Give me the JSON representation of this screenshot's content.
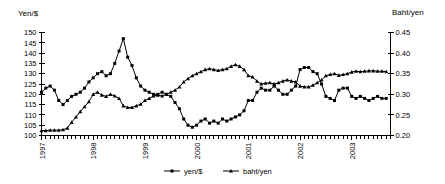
{
  "chart_data": {
    "type": "line",
    "title": "",
    "xlabel": "",
    "ylabel": "Yen/$",
    "y2label": "Baht/yen",
    "grid": false,
    "legend_position": "bottom-center",
    "xlim": [
      1997.0,
      2003.75
    ],
    "ylim": [
      100,
      150
    ],
    "y2lim": [
      0.2,
      0.45
    ],
    "ytick_labels": [
      "100",
      "105",
      "110",
      "115",
      "120",
      "125",
      "130",
      "135",
      "140",
      "145",
      "150"
    ],
    "ytick_values": [
      100,
      105,
      110,
      115,
      120,
      125,
      130,
      135,
      140,
      145,
      150
    ],
    "y2tick_labels": [
      "0.20",
      "0.25",
      "0.30",
      "0.35",
      "0.40",
      "0.45"
    ],
    "y2tick_values": [
      0.2,
      0.25,
      0.3,
      0.35,
      0.4,
      0.45
    ],
    "xtick_labels": [
      "1997",
      "1998",
      "1999",
      "2000",
      "2001",
      "2002",
      "2003"
    ],
    "xtick_values": [
      1997,
      1998,
      1999,
      2000,
      2001,
      2002,
      2003
    ],
    "x_minor_tick_interval_months": 1,
    "series": [
      {
        "name": "yen/$",
        "axis": "left",
        "marker": "square",
        "x": [
          1997.0,
          1997.083,
          1997.167,
          1997.25,
          1997.333,
          1997.417,
          1997.5,
          1997.583,
          1997.667,
          1997.75,
          1997.833,
          1997.917,
          1998.0,
          1998.083,
          1998.167,
          1998.25,
          1998.333,
          1998.417,
          1998.5,
          1998.583,
          1998.667,
          1998.75,
          1998.833,
          1998.917,
          1999.0,
          1999.083,
          1999.167,
          1999.25,
          1999.333,
          1999.417,
          1999.5,
          1999.583,
          1999.667,
          1999.75,
          1999.833,
          1999.917,
          2000.0,
          2000.083,
          2000.167,
          2000.25,
          2000.333,
          2000.417,
          2000.5,
          2000.583,
          2000.667,
          2000.75,
          2000.833,
          2000.917,
          2001.0,
          2001.083,
          2001.167,
          2001.25,
          2001.333,
          2001.417,
          2001.5,
          2001.583,
          2001.667,
          2001.75,
          2001.833,
          2001.917,
          2002.0,
          2002.083,
          2002.167,
          2002.25,
          2002.333,
          2002.417,
          2002.5,
          2002.583,
          2002.667,
          2002.75,
          2002.833,
          2002.917,
          2003.0,
          2003.083,
          2003.167,
          2003.25,
          2003.333,
          2003.417,
          2003.5,
          2003.583,
          2003.667
        ],
        "values": [
          121,
          123,
          124,
          122,
          117,
          115,
          117,
          119,
          120,
          121,
          123,
          126,
          128,
          130,
          131,
          129,
          130,
          135,
          141,
          147,
          138,
          134,
          128,
          124,
          122,
          121,
          120,
          120,
          121,
          120,
          119,
          116,
          113,
          108,
          105,
          104,
          105,
          107,
          108,
          106,
          107,
          106,
          108,
          107,
          108,
          109,
          110,
          112,
          117,
          117,
          121,
          123,
          122,
          122,
          124,
          122,
          120,
          120,
          122,
          124,
          132,
          133,
          133,
          131,
          130,
          125,
          119,
          118,
          117,
          122,
          123,
          123,
          119,
          118,
          119,
          118,
          117,
          118,
          119,
          118,
          118
        ]
      },
      {
        "name": "baht/yen",
        "axis": "right",
        "marker": "triangle",
        "x": [
          1997.0,
          1997.083,
          1997.167,
          1997.25,
          1997.333,
          1997.417,
          1997.5,
          1997.583,
          1997.667,
          1997.75,
          1997.833,
          1997.917,
          1998.0,
          1998.083,
          1998.167,
          1998.25,
          1998.333,
          1998.417,
          1998.5,
          1998.583,
          1998.667,
          1998.75,
          1998.833,
          1998.917,
          1999.0,
          1999.083,
          1999.167,
          1999.25,
          1999.333,
          1999.417,
          1999.5,
          1999.583,
          1999.667,
          1999.75,
          1999.833,
          1999.917,
          2000.0,
          2000.083,
          2000.167,
          2000.25,
          2000.333,
          2000.417,
          2000.5,
          2000.583,
          2000.667,
          2000.75,
          2000.833,
          2000.917,
          2001.0,
          2001.083,
          2001.167,
          2001.25,
          2001.333,
          2001.417,
          2001.5,
          2001.583,
          2001.667,
          2001.75,
          2001.833,
          2001.917,
          2002.0,
          2002.083,
          2002.167,
          2002.25,
          2002.333,
          2002.417,
          2002.5,
          2002.583,
          2002.667,
          2002.75,
          2002.833,
          2002.917,
          2003.0,
          2003.083,
          2003.167,
          2003.25,
          2003.333,
          2003.417,
          2003.5,
          2003.583,
          2003.667
        ],
        "values": [
          0.212,
          0.212,
          0.213,
          0.213,
          0.213,
          0.214,
          0.218,
          0.232,
          0.245,
          0.258,
          0.27,
          0.282,
          0.3,
          0.305,
          0.298,
          0.295,
          0.3,
          0.296,
          0.29,
          0.272,
          0.268,
          0.268,
          0.272,
          0.276,
          0.285,
          0.29,
          0.296,
          0.298,
          0.296,
          0.3,
          0.305,
          0.31,
          0.318,
          0.33,
          0.338,
          0.345,
          0.35,
          0.355,
          0.36,
          0.362,
          0.36,
          0.358,
          0.36,
          0.362,
          0.368,
          0.372,
          0.368,
          0.36,
          0.345,
          0.342,
          0.332,
          0.325,
          0.327,
          0.328,
          0.325,
          0.328,
          0.332,
          0.335,
          0.332,
          0.33,
          0.32,
          0.318,
          0.318,
          0.322,
          0.328,
          0.335,
          0.345,
          0.348,
          0.35,
          0.346,
          0.348,
          0.35,
          0.354,
          0.356,
          0.355,
          0.356,
          0.357,
          0.357,
          0.356,
          0.356,
          0.355
        ]
      }
    ]
  },
  "legend": {
    "items": [
      {
        "label": "yen/$",
        "marker": "square"
      },
      {
        "label": "baht/yen",
        "marker": "triangle"
      }
    ]
  }
}
